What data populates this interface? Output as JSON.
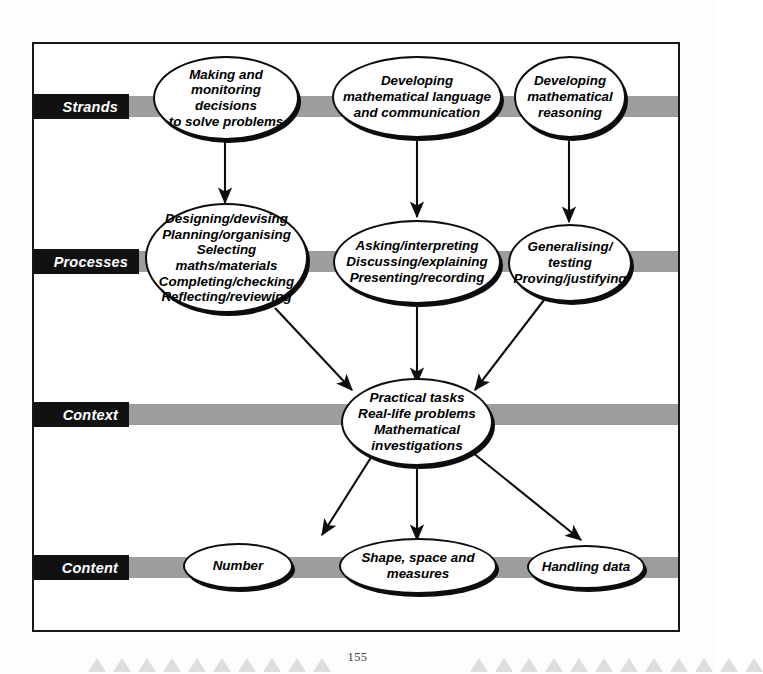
{
  "page": {
    "number": "155",
    "title": "Mathematics curriculum framework",
    "frame_color": "#17181a",
    "band_color": "#9d9d9d",
    "label_bar_color": "#111112",
    "label_text_color": "#ffffff",
    "node_border_color": "#0d0d0f"
  },
  "rows": [
    {
      "id": "strands",
      "label": "Strands"
    },
    {
      "id": "processes",
      "label": "Processes"
    },
    {
      "id": "context",
      "label": "Context"
    },
    {
      "id": "content",
      "label": "Content"
    }
  ],
  "nodes": {
    "strand_1": "Making and\nmonitoring decisions\nto solve problems",
    "strand_2": "Developing\nmathematical language\nand communication",
    "strand_3": "Developing\nmathematical\nreasoning",
    "process_1": "Designing/devising\nPlanning/organising\nSelecting maths/materials\nCompleting/checking\nReflecting/reviewing",
    "process_2": "Asking/interpreting\nDiscussing/explaining\nPresenting/recording",
    "process_3": "Generalising/\ntesting\nProving/justifying",
    "context_1": "Practical tasks\nReal-life problems\nMathematical\ninvestigations",
    "content_1": "Number",
    "content_2": "Shape, space and\nmeasures",
    "content_3": "Handling data"
  },
  "edges": [
    {
      "from": "strand_1",
      "to": "process_1",
      "kind": "vertical-arrow"
    },
    {
      "from": "strand_2",
      "to": "process_2",
      "kind": "vertical-arrow"
    },
    {
      "from": "strand_3",
      "to": "process_3",
      "kind": "vertical-arrow"
    },
    {
      "from": "process_1",
      "to": "context_1",
      "kind": "diagonal-arrow"
    },
    {
      "from": "process_2",
      "to": "context_1",
      "kind": "vertical-arrow"
    },
    {
      "from": "process_3",
      "to": "context_1",
      "kind": "diagonal-arrow"
    },
    {
      "from": "context_1",
      "to": "content_1",
      "kind": "diagonal-arrow"
    },
    {
      "from": "context_1",
      "to": "content_2",
      "kind": "vertical-arrow"
    },
    {
      "from": "context_1",
      "to": "content_3",
      "kind": "diagonal-arrow"
    }
  ],
  "footer": {
    "triangle_count_left": 10,
    "triangle_count_right": 12,
    "triangle_color": "#dededc"
  }
}
